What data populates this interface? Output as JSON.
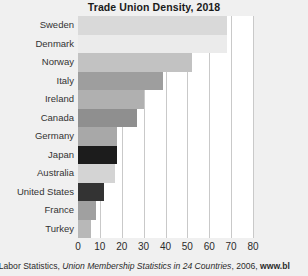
{
  "chart_data": {
    "type": "bar",
    "orientation": "horizontal",
    "title": "Trade Union Density, 2018",
    "xlabel": "",
    "ylabel": "",
    "xlim": [
      0,
      80
    ],
    "xticks": [
      0,
      10,
      20,
      30,
      40,
      50,
      60,
      70,
      80
    ],
    "grid": true,
    "legend": null,
    "categories": [
      "Sweden",
      "Denmark",
      "Norway",
      "Italy",
      "Ireland",
      "Canada",
      "Germany",
      "Japan",
      "Australia",
      "United States",
      "France",
      "Turkey"
    ],
    "values": [
      68,
      68,
      52,
      39,
      30,
      27,
      18,
      18,
      17,
      12,
      8,
      6
    ],
    "bar_colors": [
      "#d9d9d9",
      "#ebebeb",
      "#c2c2c2",
      "#9e9e9e",
      "#b0b0b0",
      "#8f8f8f",
      "#a8a8a8",
      "#1c1c1c",
      "#d4d4d4",
      "#333333",
      "#a0a0a0",
      "#b8b8b8"
    ]
  },
  "caption": {
    "part_plain_1": "f Labor Statistics, ",
    "part_italic": "Union Membership Statistics in 24 Countries",
    "part_plain_2": ", 2006, ",
    "part_bold": "www.bl"
  },
  "colors": {
    "background": "#f0f0f0",
    "plot_background": "#ffffff",
    "gridline": "#c9c9c9",
    "title": "#1a1a1a",
    "label": "#333333"
  }
}
